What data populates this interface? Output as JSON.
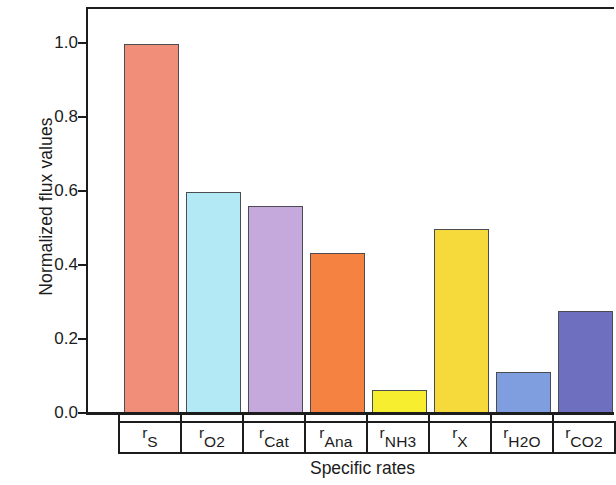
{
  "chart_data": {
    "type": "bar",
    "title": "",
    "xlabel": "Specific rates",
    "ylabel": "Normalized flux values",
    "categories": [
      "r_S",
      "r_O2",
      "r_Cat",
      "r_Ana",
      "r_NH3",
      "r_X",
      "r_H2O",
      "r_CO2"
    ],
    "category_labels": [
      {
        "base": "r",
        "sub": "S"
      },
      {
        "base": "r",
        "sub": "O2"
      },
      {
        "base": "r",
        "sub": "Cat"
      },
      {
        "base": "r",
        "sub": "Ana"
      },
      {
        "base": "r",
        "sub": "NH3"
      },
      {
        "base": "r",
        "sub": "X"
      },
      {
        "base": "r",
        "sub": "H2O"
      },
      {
        "base": "r",
        "sub": "CO2"
      }
    ],
    "values": [
      1.0,
      0.6,
      0.562,
      0.435,
      0.065,
      0.5,
      0.114,
      0.278
    ],
    "colors": [
      "#F08E7A",
      "#B3E8F5",
      "#C5A8DC",
      "#F58240",
      "#F7EE30",
      "#F6DA3C",
      "#7E9EE0",
      "#6E6FBE"
    ],
    "bar_edge_color": "#4b4b52",
    "ylim": [
      0.0,
      1.1
    ],
    "yticks": [
      0.0,
      0.2,
      0.4,
      0.6,
      0.8,
      1.0
    ],
    "ytick_labels": [
      "0.0",
      "0.2",
      "0.4",
      "0.6",
      "0.8",
      "1.0"
    ],
    "grid": false,
    "legend": false
  },
  "axis": {
    "y_title": "Normalized flux values",
    "x_title": "Specific rates",
    "tick_0": "0.0",
    "tick_1": "0.2",
    "tick_2": "0.4",
    "tick_3": "0.6",
    "tick_4": "0.8",
    "tick_5": "1.0"
  }
}
